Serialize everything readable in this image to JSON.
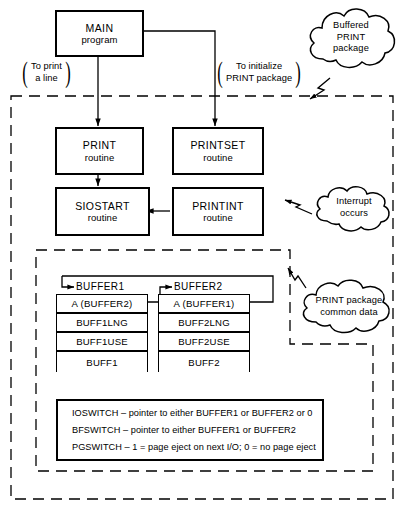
{
  "diagram": {
    "colors": {
      "line": "#000000",
      "background": "#ffffff"
    },
    "boxes": [
      {
        "id": "main",
        "line1": "MAIN",
        "line2": "program"
      },
      {
        "id": "print",
        "line1": "PRINT",
        "line2": "routine"
      },
      {
        "id": "printset",
        "line1": "PRINTSET",
        "line2": "routine"
      },
      {
        "id": "siostart",
        "line1": "SIOSTART",
        "line2": "routine"
      },
      {
        "id": "printint",
        "line1": "PRINTINT",
        "line2": "routine"
      }
    ],
    "edge_labels": [
      {
        "id": "to-print-a-line",
        "line1": "To print",
        "line2": "a line"
      },
      {
        "id": "to-initialize-print",
        "line1": "To initialize",
        "line2": "PRINT package"
      }
    ],
    "clouds": [
      {
        "id": "buffered-print-package",
        "lines": [
          "Buffered",
          "PRINT",
          "package"
        ]
      },
      {
        "id": "interrupt-occurs",
        "lines": [
          "Interrupt",
          "occurs"
        ]
      },
      {
        "id": "print-package-common-data",
        "lines": [
          "PRINT package",
          "common data"
        ]
      }
    ],
    "buffers": [
      {
        "id": "buffer1",
        "name": "BUFFER1",
        "fields": [
          "A (BUFFER2)",
          "BUFF1LNG",
          "BUFF1USE",
          "BUFF1"
        ]
      },
      {
        "id": "buffer2",
        "name": "BUFFER2",
        "fields": [
          "A (BUFFER1)",
          "BUFF2LNG",
          "BUFF2USE",
          "BUFF2"
        ]
      }
    ],
    "switches": [
      "IOSWITCH – pointer to either BUFFER1 or BUFFER2 or 0",
      "BFSWITCH – pointer to either BUFFER1 or BUFFER2",
      "PGSWITCH – 1 = page eject on next I/O; 0 = no page eject"
    ]
  }
}
